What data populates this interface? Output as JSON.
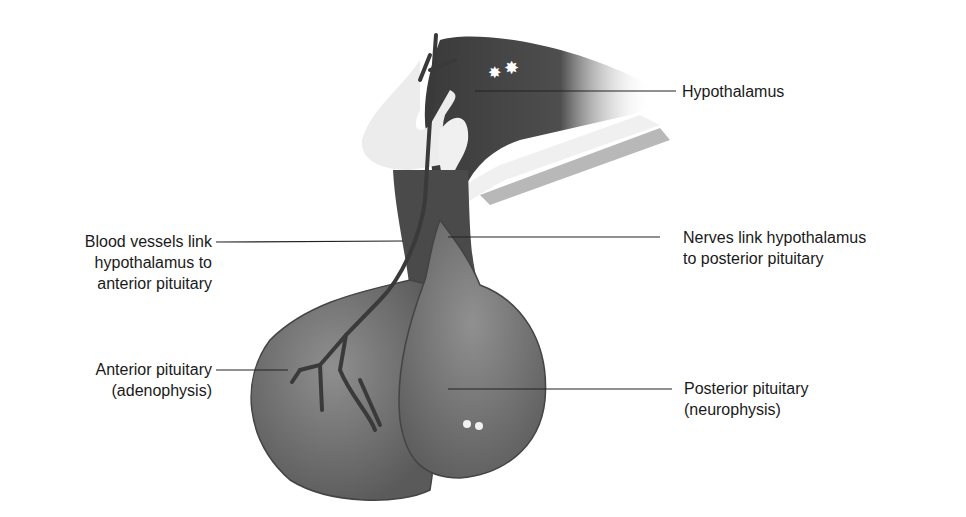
{
  "diagram": {
    "colors": {
      "tissue_dark": "#3a3a3a",
      "tissue_mid": "#6a6a6a",
      "tissue_light": "#8c8c8c",
      "membrane": "#e8e8e8",
      "leader_line": "#222222"
    },
    "labels": {
      "hypothalamus": "Hypothalamus",
      "blood_vessels": "Blood vessels link\nhypothalamus to\nanterior pituitary",
      "nerves": "Nerves link hypothalamus\nto posterior pituitary",
      "anterior": "Anterior pituitary\n(adenophysis)",
      "posterior": "Posterior pituitary\n(neurophysis)"
    }
  }
}
